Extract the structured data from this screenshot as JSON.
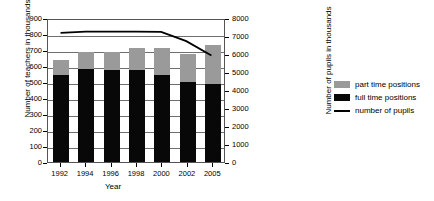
{
  "chart_data": {
    "type": "bar",
    "title": "",
    "subtitle": "",
    "xlabel": "Year",
    "ylabel": "Number of teachers in thousands",
    "y2label": "Number of pupils in thousands",
    "categories": [
      "1992",
      "1994",
      "1996",
      "1998",
      "2000",
      "2002",
      "2005"
    ],
    "ylim": [
      0,
      900
    ],
    "y2lim": [
      0,
      8000
    ],
    "yticks": [
      0,
      100,
      200,
      300,
      400,
      500,
      600,
      700,
      800,
      900
    ],
    "y2ticks": [
      0,
      1000,
      2000,
      3000,
      4000,
      5000,
      6000,
      7000,
      8000
    ],
    "grid": true,
    "legend_position": "right",
    "series": [
      {
        "name": "full time positions",
        "type": "bar-segment",
        "axis": "left",
        "color": "#080808",
        "values": [
          544,
          581,
          575,
          575,
          544,
          500,
          488
        ]
      },
      {
        "name": "part time positions",
        "type": "bar-segment",
        "axis": "left",
        "color": "#9a9a9a",
        "values": [
          93,
          106,
          112,
          137,
          169,
          175,
          243
        ]
      },
      {
        "name": "number of pupils",
        "type": "line",
        "axis": "right",
        "color": "#000000",
        "values": [
          7280,
          7340,
          7350,
          7350,
          7330,
          6810,
          6000
        ]
      }
    ],
    "stack_totals": [
      637,
      687,
      687,
      712,
      713,
      675,
      731
    ]
  },
  "legend": {
    "items": [
      {
        "label": "part time positions",
        "swatch": "gray-square-swatch"
      },
      {
        "label": "full time positions",
        "swatch": "black-square-swatch"
      },
      {
        "label": "number of pupils",
        "swatch": "black-line-swatch"
      }
    ]
  },
  "colors": {
    "part_time": "#9a9a9a",
    "full_time": "#080808",
    "pupils_line": "#000000",
    "grid": "#6e6e6e",
    "frame": "#555555",
    "background": "#ffffff"
  }
}
